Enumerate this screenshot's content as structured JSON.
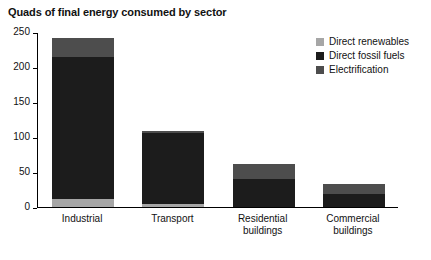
{
  "chart_data": {
    "type": "bar",
    "title": "Quads of final energy consumed by sector",
    "xlabel": "",
    "ylabel": "",
    "ylim": [
      0,
      250
    ],
    "yticks": [
      0,
      50,
      100,
      150,
      200,
      250
    ],
    "grid": false,
    "stacked": true,
    "legend_position": "top-right",
    "categories": [
      "Industrial",
      "Transport",
      "Residential buildings",
      "Commercial buildings"
    ],
    "category_lines": [
      [
        "Industrial"
      ],
      [
        "Transport"
      ],
      [
        "Residential",
        "buildings"
      ],
      [
        "Commercial",
        "buildings"
      ]
    ],
    "series": [
      {
        "name": "Electrification",
        "color": "#4d4d4d",
        "values": [
          28,
          2,
          22,
          14
        ]
      },
      {
        "name": "Direct fossil fuels",
        "color": "#1c1c1c",
        "values": [
          202,
          101,
          40,
          19
        ]
      },
      {
        "name": "Direct renewables",
        "color": "#a6a6a6",
        "values": [
          12,
          5,
          0,
          0
        ]
      }
    ],
    "totals": [
      242,
      108,
      62,
      33
    ],
    "legend": [
      {
        "label": "Direct renewables",
        "color": "#a6a6a6"
      },
      {
        "label": "Direct fossil fuels",
        "color": "#1c1c1c"
      },
      {
        "label": "Electrification",
        "color": "#4d4d4d"
      }
    ]
  }
}
